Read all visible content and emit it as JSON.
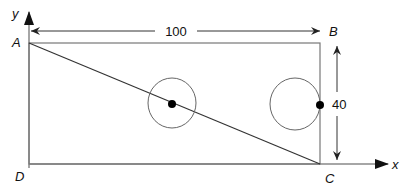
{
  "figure": {
    "axes": {
      "x_label": "x",
      "y_label": "y"
    },
    "points": {
      "A": "A",
      "B": "B",
      "C": "C",
      "D": "D"
    },
    "dimensions": {
      "width": "100",
      "height": "40"
    },
    "elements": {
      "rectangle": "ABCD",
      "diagonal": "AC",
      "circles": [
        {
          "name": "center-circle",
          "dot": "on diagonal"
        },
        {
          "name": "right-circle",
          "dot": "on edge BC"
        }
      ]
    },
    "colors": {
      "stroke": "#333333",
      "dots": "#000000"
    }
  }
}
